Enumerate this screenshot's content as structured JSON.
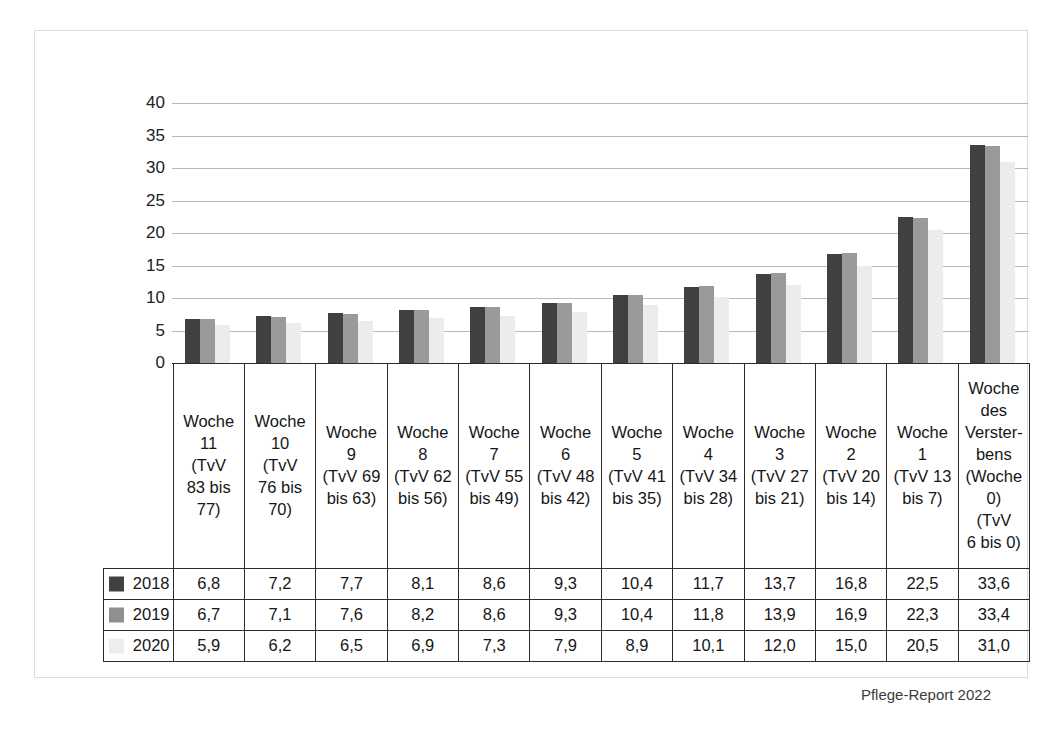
{
  "footer": {
    "source": "Pflege-Report 2022"
  },
  "chart_data": {
    "type": "bar",
    "title": "",
    "xlabel": "",
    "ylabel": "",
    "ylim": [
      0,
      40
    ],
    "yticks": [
      0,
      5,
      10,
      15,
      20,
      25,
      30,
      35,
      40
    ],
    "ytick_labels": [
      "0",
      "5",
      "10",
      "15",
      "20",
      "25",
      "30",
      "35",
      "40"
    ],
    "grid": true,
    "legend_position": "table-row-headers",
    "categories": [
      "Woche 11 (TvV 83 bis 77)",
      "Woche 10 (TvV 76 bis 70)",
      "Woche 9 (TvV 69 bis 63)",
      "Woche 8 (TvV 62 bis 56)",
      "Woche 7 (TvV 55 bis 49)",
      "Woche 6 (TvV 48 bis 42)",
      "Woche 5 (TvV 41 bis 35)",
      "Woche 4 (TvV 34 bis 28)",
      "Woche 3 (TvV 27 bis 21)",
      "Woche 2 (TvV 20 bis 14)",
      "Woche 1 (TvV 13 bis 7)",
      "Woche des Versterbens (Woche 0) (TvV 6 bis 0)"
    ],
    "category_lines": [
      [
        "Woche",
        "11",
        "(TvV",
        "83 bis",
        "77)"
      ],
      [
        "Woche",
        "10",
        "(TvV",
        "76 bis",
        "70)"
      ],
      [
        "Woche",
        "9",
        "(TvV 69",
        "bis 63)"
      ],
      [
        "Woche",
        "8",
        "(TvV 62",
        "bis 56)"
      ],
      [
        "Woche",
        "7",
        "(TvV 55",
        "bis 49)"
      ],
      [
        "Woche",
        "6",
        "(TvV 48",
        "bis 42)"
      ],
      [
        "Woche",
        "5",
        "(TvV 41",
        "bis 35)"
      ],
      [
        "Woche",
        "4",
        "(TvV 34",
        "bis 28)"
      ],
      [
        "Woche",
        "3",
        "(TvV 27",
        "bis 21)"
      ],
      [
        "Woche",
        "2",
        "(TvV 20",
        "bis 14)"
      ],
      [
        "Woche",
        "1",
        "(TvV 13",
        "bis 7)"
      ],
      [
        "Woche",
        "des",
        "Verster-",
        "bens",
        "(Woche",
        "0)",
        "(TvV",
        "6 bis 0)"
      ]
    ],
    "series": [
      {
        "name": "2018",
        "color": "#404040",
        "values": [
          6.8,
          7.2,
          7.7,
          8.1,
          8.6,
          9.3,
          10.4,
          11.7,
          13.7,
          16.8,
          22.5,
          33.6
        ],
        "labels": [
          "6,8",
          "7,2",
          "7,7",
          "8,1",
          "8,6",
          "9,3",
          "10,4",
          "11,7",
          "13,7",
          "16,8",
          "22,5",
          "33,6"
        ]
      },
      {
        "name": "2019",
        "color": "#9a9a9a",
        "values": [
          6.7,
          7.1,
          7.6,
          8.2,
          8.6,
          9.3,
          10.4,
          11.8,
          13.9,
          16.9,
          22.3,
          33.4
        ],
        "labels": [
          "6,7",
          "7,1",
          "7,6",
          "8,2",
          "8,6",
          "9,3",
          "10,4",
          "11,8",
          "13,9",
          "16,9",
          "22,3",
          "33,4"
        ]
      },
      {
        "name": "2020",
        "color": "#ececec",
        "values": [
          5.9,
          6.2,
          6.5,
          6.9,
          7.3,
          7.9,
          8.9,
          10.1,
          12.0,
          15.0,
          20.5,
          31.0
        ],
        "labels": [
          "5,9",
          "6,2",
          "6,5",
          "6,9",
          "7,3",
          "7,9",
          "8,9",
          "10,1",
          "12,0",
          "15,0",
          "20,5",
          "31,0"
        ]
      }
    ]
  }
}
